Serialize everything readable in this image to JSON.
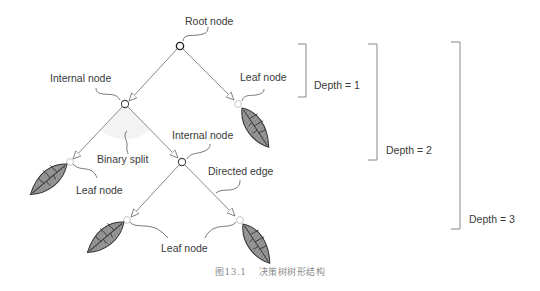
{
  "diagram": {
    "labels": {
      "root": "Root node",
      "internal_1": "Internal node",
      "internal_2": "Internal node",
      "leaf_1": "Leaf node",
      "leaf_2": "Leaf node",
      "leaf_3": "Leaf node",
      "binary_split": "Binary split",
      "directed_edge": "Directed edge"
    },
    "depths": [
      {
        "label": "Depth = 1"
      },
      {
        "label": "Depth = 2"
      },
      {
        "label": "Depth = 3"
      }
    ],
    "colors": {
      "edge": "#8a8a8a",
      "node_root": "#333333",
      "node_leaf": "#c8c8c8",
      "leaf_fill": "#8c8c8c",
      "leaf_stripe": "#b5b5b5",
      "split_shade": "#f2f2f2"
    }
  },
  "caption": {
    "figure_number": "图13.1",
    "text": "决策树树形结构"
  }
}
